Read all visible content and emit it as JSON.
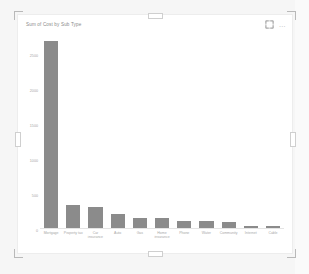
{
  "visual": {
    "title": "Sum of Cost by Sub Type",
    "icons": {
      "focus": "focus-mode-icon",
      "more": "more-options-icon",
      "more_glyph": "…"
    }
  },
  "chart_data": {
    "type": "bar",
    "title": "Sum of Cost by Sub Type",
    "xlabel": "Sub Type",
    "ylabel": "Sum of Cost",
    "grid": false,
    "legend": "none",
    "ylim": [
      0,
      2800
    ],
    "yticks": [
      "2500",
      "2000",
      "1500",
      "1000",
      "500",
      "0"
    ],
    "ytick_values": [
      2500,
      2000,
      1500,
      1000,
      500,
      0
    ],
    "categories": [
      "Mortgage",
      "Property tax",
      "Car insurance",
      "Auto",
      "Gas",
      "Home insurance",
      "Phone",
      "Water",
      "Community",
      "Internet",
      "Cable"
    ],
    "values": [
      2700,
      330,
      300,
      205,
      145,
      145,
      105,
      105,
      80,
      32,
      25
    ]
  }
}
